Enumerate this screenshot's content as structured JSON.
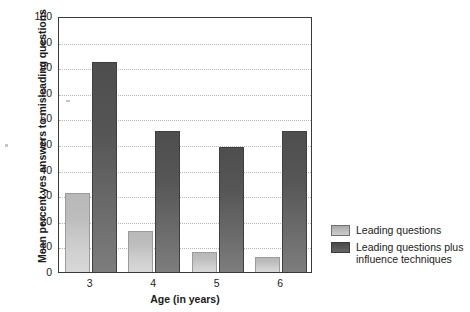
{
  "chart_data": {
    "type": "bar",
    "title": "",
    "subtitle": "",
    "xlabel": "Age (in years)",
    "ylabel": "Mean percent yes answers to misleading questions",
    "categories": [
      "3",
      "4",
      "5",
      "6"
    ],
    "series": [
      {
        "name": "Leading questions",
        "values": [
          31,
          16,
          8,
          6
        ],
        "color": "#c2c2c2"
      },
      {
        "name": "Leading questions plus\ninfluence techniques",
        "values": [
          82,
          55,
          49,
          55
        ],
        "color": "#5a5a5a"
      }
    ],
    "ylim": [
      0,
      100
    ],
    "yticks": [
      0,
      10,
      20,
      30,
      40,
      50,
      60,
      70,
      80,
      90,
      100
    ],
    "ytick_labels": [
      "0",
      "10",
      "20",
      "30",
      "40",
      "50",
      "60",
      "70",
      "80",
      "90",
      "100"
    ],
    "grid": true,
    "grid_axis": "y",
    "grid_style": "dotted",
    "legend_position": "right",
    "frame_color": "#3a3a3a",
    "background": "#ffffff"
  },
  "legend": {
    "entries": [
      {
        "label": "Leading questions",
        "swatch": "light-gray-swatch"
      },
      {
        "label": "Leading questions plus\ninfluence techniques",
        "swatch": "dark-gray-swatch"
      }
    ]
  }
}
